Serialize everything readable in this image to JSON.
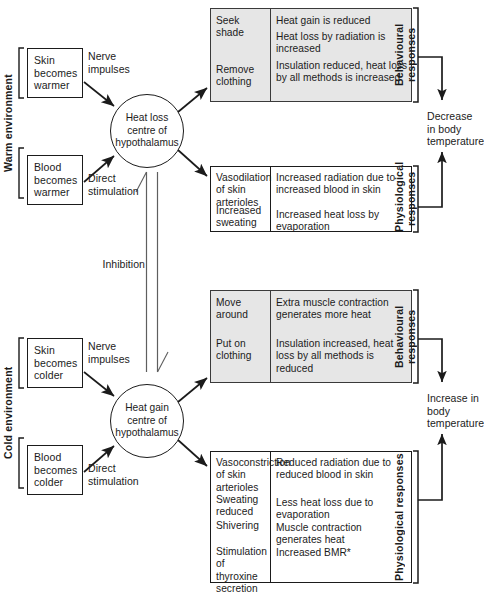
{
  "figure": {
    "colors": {
      "line": "#1b1b1b",
      "shaded_fill": "#e6e6e6",
      "plain_fill": "#ffffff"
    }
  },
  "warm": {
    "side_label": "Warm environment",
    "stimuli": [
      {
        "text": "Skin becomes warmer",
        "arrow_label": "Nerve impulses"
      },
      {
        "text": "Blood becomes warmer",
        "arrow_label": "Direct stimulation"
      }
    ],
    "centre": "Heat loss centre of hypothalamus",
    "behavioural": {
      "label": "Behavioural responses",
      "rows": [
        {
          "action": "Seek shade",
          "effect": "Heat gain is reduced"
        },
        {
          "action": "",
          "effect": "Heat loss by radiation is increased"
        },
        {
          "action": "Remove clothing",
          "effect": "Insulation reduced, heat loss by all methods is increased"
        }
      ]
    },
    "physiological": {
      "label": "Physiological responses",
      "rows": [
        {
          "action": "Vasodilation of skin arterioles",
          "effect": "Increased radiation due to increased blood in skin"
        },
        {
          "action": "Increased sweating",
          "effect": "Increased heat loss by evaporation"
        }
      ]
    },
    "outcome": "Decrease in body temperature"
  },
  "cold": {
    "side_label": "Cold environment",
    "stimuli": [
      {
        "text": "Skin becomes colder",
        "arrow_label": "Nerve impulses"
      },
      {
        "text": "Blood becomes colder",
        "arrow_label": "Direct stimulation"
      }
    ],
    "centre": "Heat gain centre of hypothalamus",
    "behavioural": {
      "label": "Behavioural responses",
      "rows": [
        {
          "action": "Move around",
          "effect": "Extra muscle contraction generates more heat"
        },
        {
          "action": "Put on clothing",
          "effect": "Insulation increased, heat loss by all methods is reduced"
        }
      ]
    },
    "physiological": {
      "label": "Physiological responses",
      "rows": [
        {
          "action": "Vasoconstriction of skin arterioles",
          "effect": "Reduced radiation due to reduced blood in skin"
        },
        {
          "action": "Sweating reduced",
          "effect": "Less heat loss due to evaporation"
        },
        {
          "action": "Shivering",
          "effect": "Muscle contraction generates heat"
        },
        {
          "action": "Stimulation of thyroxine secretion",
          "effect": "Increased BMR*"
        }
      ]
    },
    "outcome": "Increase in body temperature"
  },
  "inhibition": {
    "label": "Inhibition"
  }
}
